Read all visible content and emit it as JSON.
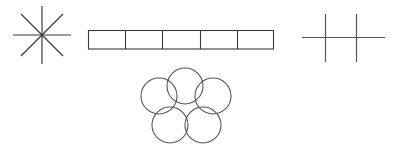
{
  "canvas": {
    "width": 399,
    "height": 148,
    "background": "#ffffff",
    "stroke_color": "#3b3b3b",
    "stroke_color_light": "#565656",
    "stroke_width": 1.1,
    "fill": "none"
  },
  "figure": {
    "shape_count": 4
  },
  "shapes": {
    "asterisk": {
      "name": "eight-ray asterisk",
      "ray_count": 8,
      "line_count": 4,
      "center_x": 42,
      "center_y": 35,
      "radius": 29,
      "angles_deg": [
        0,
        45,
        90,
        135
      ],
      "lines": [
        {
          "x1": 13,
          "y1": 35,
          "x2": 71,
          "y2": 35
        },
        {
          "x1": 42,
          "y1": 6,
          "x2": 42,
          "y2": 64
        },
        {
          "x1": 21,
          "y1": 14,
          "x2": 63,
          "y2": 56
        },
        {
          "x1": 21,
          "y1": 56,
          "x2": 63,
          "y2": 14
        }
      ]
    },
    "segmented_bar": {
      "name": "segmented rectangle bar",
      "cell_count": 5,
      "x": 88,
      "y": 30,
      "width": 186,
      "height": 19,
      "cell_width": 37.2,
      "divider_x_positions": [
        125.2,
        162.4,
        199.6,
        236.8
      ],
      "cells": [
        {
          "index": 1,
          "label": ""
        },
        {
          "index": 2,
          "label": ""
        },
        {
          "index": 3,
          "label": ""
        },
        {
          "index": 4,
          "label": ""
        },
        {
          "index": 5,
          "label": ""
        }
      ]
    },
    "circle_cluster": {
      "name": "pentagonal cluster of circles",
      "circle_count": 5,
      "radius": 18,
      "cluster_center_x": 186,
      "cluster_center_y": 106,
      "circles": [
        {
          "index": 1,
          "position": "top",
          "cx": 185,
          "cy": 86
        },
        {
          "index": 2,
          "position": "upper-left",
          "cx": 159,
          "cy": 96
        },
        {
          "index": 3,
          "position": "upper-right",
          "cx": 213,
          "cy": 96
        },
        {
          "index": 4,
          "position": "lower-left",
          "cx": 170,
          "cy": 125
        },
        {
          "index": 5,
          "position": "lower-right",
          "cx": 203,
          "cy": 125
        }
      ]
    },
    "double_cross": {
      "name": "double cross (two verticals crossed by one horizontal)",
      "vertical_count": 2,
      "horizontal_count": 1,
      "lines": [
        {
          "role": "horizontal",
          "x1": 302,
          "y1": 37,
          "x2": 385,
          "y2": 37
        },
        {
          "role": "vertical-left",
          "x1": 325,
          "y1": 14,
          "x2": 325,
          "y2": 62
        },
        {
          "role": "vertical-right",
          "x1": 356,
          "y1": 14,
          "x2": 356,
          "y2": 62
        }
      ]
    }
  }
}
